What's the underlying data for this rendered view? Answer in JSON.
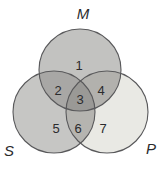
{
  "diagram": {
    "type": "venn-3-circle",
    "set_labels": {
      "top": "M",
      "bottom_left": "S",
      "bottom_right": "P"
    },
    "regions": [
      {
        "value": "1",
        "name": "M-only"
      },
      {
        "value": "2",
        "name": "M-and-S"
      },
      {
        "value": "3",
        "name": "M-and-S-and-P"
      },
      {
        "value": "4",
        "name": "M-and-P"
      },
      {
        "value": "5",
        "name": "S-only"
      },
      {
        "value": "6",
        "name": "S-and-P"
      },
      {
        "value": "7",
        "name": "P-only"
      }
    ],
    "colors": {
      "m_only": "#c2c2c0",
      "s_only": "#c6c6c4",
      "p_only": "#e9e9e4",
      "m_s_overlap": "#a8a7a5",
      "m_p_overlap": "#b2b1ad",
      "s_p_overlap": "#b5b4b0",
      "center_overlap": "#9a9996",
      "outline": "#59595b",
      "text": "#2b2b2d",
      "background": "#ffffff"
    }
  }
}
